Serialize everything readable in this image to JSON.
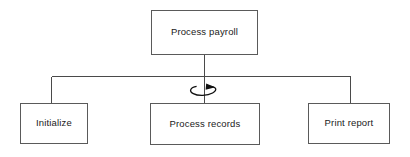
{
  "diagram": {
    "type": "structure-chart",
    "background_color": "#ffffff",
    "line_color": "#4a4a4a",
    "text_color": "#1a1a1a",
    "nodes": {
      "root": {
        "label": "Process payroll",
        "level": 0
      },
      "children": [
        {
          "label": "Initialize",
          "level": 1
        },
        {
          "label": "Process records",
          "level": 1
        },
        {
          "label": "Print report",
          "level": 1
        }
      ]
    },
    "annotations": {
      "loop_symbol": {
        "name": "iteration-loop-arrow",
        "attached_to": "Process records",
        "description": "curved loop arrow indicating repetition"
      }
    }
  }
}
